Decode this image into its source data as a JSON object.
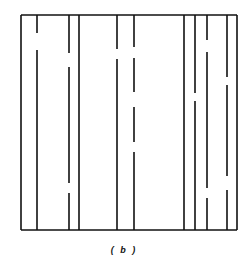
{
  "figure": {
    "caption": "( b )",
    "stroke_color": "#111111",
    "box": {
      "left": 21,
      "top": 15,
      "right": 237,
      "bottom": 230
    },
    "lines": [
      {
        "x": 37,
        "gaps": [
          [
            33,
            50
          ]
        ]
      },
      {
        "x": 69,
        "gaps": [
          [
            53,
            67
          ],
          [
            183,
            193
          ]
        ]
      },
      {
        "x": 79,
        "gaps": []
      },
      {
        "x": 117,
        "gaps": [
          [
            49,
            59
          ]
        ]
      },
      {
        "x": 134,
        "gaps": [
          [
            47,
            58
          ],
          [
            92,
            107
          ],
          [
            142,
            152
          ]
        ]
      },
      {
        "x": 184,
        "gaps": []
      },
      {
        "x": 195,
        "gaps": [
          [
            93,
            101
          ]
        ]
      },
      {
        "x": 207,
        "gaps": [
          [
            40,
            52
          ],
          [
            188,
            198
          ]
        ]
      },
      {
        "x": 227,
        "gaps": [
          [
            77,
            85
          ],
          [
            176,
            190
          ]
        ]
      }
    ]
  }
}
